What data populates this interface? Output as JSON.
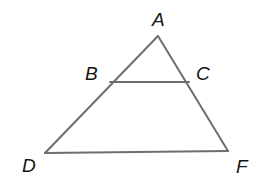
{
  "figure": {
    "kind": "geometry-diagram",
    "background_color": "#ffffff",
    "stroke_color": "#6e6e6e",
    "stroke_width": 2,
    "label_color": "#141414",
    "width": 271,
    "height": 190
  },
  "points": {
    "A": {
      "label": "A",
      "x": 158,
      "y": 36
    },
    "B": {
      "label": "B",
      "x": 110,
      "y": 82
    },
    "C": {
      "label": "C",
      "x": 189,
      "y": 82
    },
    "D": {
      "label": "D",
      "x": 45,
      "y": 153
    },
    "F": {
      "label": "F",
      "x": 228,
      "y": 151
    }
  },
  "labels": [
    {
      "name": "label-A",
      "text": "A",
      "x": 152,
      "y": 10
    },
    {
      "name": "label-B",
      "text": "B",
      "x": 85,
      "y": 64
    },
    {
      "name": "label-C",
      "text": "C",
      "x": 196,
      "y": 64
    },
    {
      "name": "label-D",
      "text": "D",
      "x": 22,
      "y": 156
    },
    {
      "name": "label-F",
      "text": "F",
      "x": 236,
      "y": 157
    }
  ],
  "segments": [
    {
      "name": "segment-AD",
      "from": "A",
      "to": "D",
      "path": "M158,36 L45,153"
    },
    {
      "name": "segment-AF",
      "from": "A",
      "to": "F",
      "path": "M158,36 L228,151"
    },
    {
      "name": "segment-DF",
      "from": "D",
      "to": "F",
      "path": "M45,153 L228,151"
    },
    {
      "name": "segment-BC",
      "from": "B",
      "to": "C",
      "path": "M110,82 L189,82"
    }
  ]
}
